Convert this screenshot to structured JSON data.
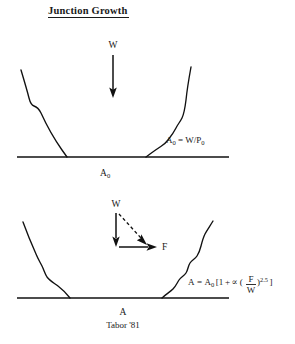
{
  "figure": {
    "title": "Junction Growth",
    "caption": "Tabor '81",
    "ink_color": "#111111",
    "background_color": "#ffffff"
  },
  "panel_top": {
    "name": "unloaded junction",
    "load_label": "W",
    "area_label": "A",
    "area_label_subscript": "0",
    "equation": {
      "lhs": "A",
      "lhs_subscript": "0",
      "equals": "=",
      "numerator": "W",
      "slash": "/",
      "denominator": "P",
      "denominator_subscript": "0",
      "full_text": "A0 = W/P0"
    }
  },
  "panel_bottom": {
    "name": "junction under combined load",
    "load_label": "W",
    "shear_label": "F",
    "resultant_label": "",
    "area_label": "A",
    "equation": {
      "lhs": "A",
      "equals": "=",
      "rhs_coefficient": "A",
      "rhs_coefficient_subscript": "0",
      "bracket_open": "[",
      "one": "1",
      "plus": "+",
      "alpha": "∝",
      "paren_open": "(",
      "frac_numerator": "F",
      "frac_denominator": "W",
      "paren_close": ")",
      "exponent": "2.5",
      "bracket_close": "]",
      "full_text": "A = A0 [1 + ∝ (F/W)^2.5 ]"
    }
  },
  "geometry": {
    "top_baseline_y": 157,
    "bottom_baseline_y": 298,
    "baseline_x_start": 17,
    "baseline_x_end": 229
  }
}
